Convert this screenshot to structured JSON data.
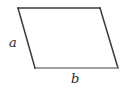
{
  "figure": {
    "kind": "parallelogram-diagram",
    "background_color": "#ffffff",
    "stroke_color": "#3b3b3b",
    "bottom_stroke_color": "#808080",
    "stroke_width": 1.5,
    "canvas": {
      "width": 127,
      "height": 89
    },
    "vertices": {
      "top_left": {
        "x": 18,
        "y": 8
      },
      "top_right": {
        "x": 100,
        "y": 8
      },
      "bottom_right": {
        "x": 118,
        "y": 68
      },
      "bottom_left": {
        "x": 35,
        "y": 68
      }
    },
    "labels": {
      "left_side": "a",
      "bottom_side": "b"
    }
  }
}
